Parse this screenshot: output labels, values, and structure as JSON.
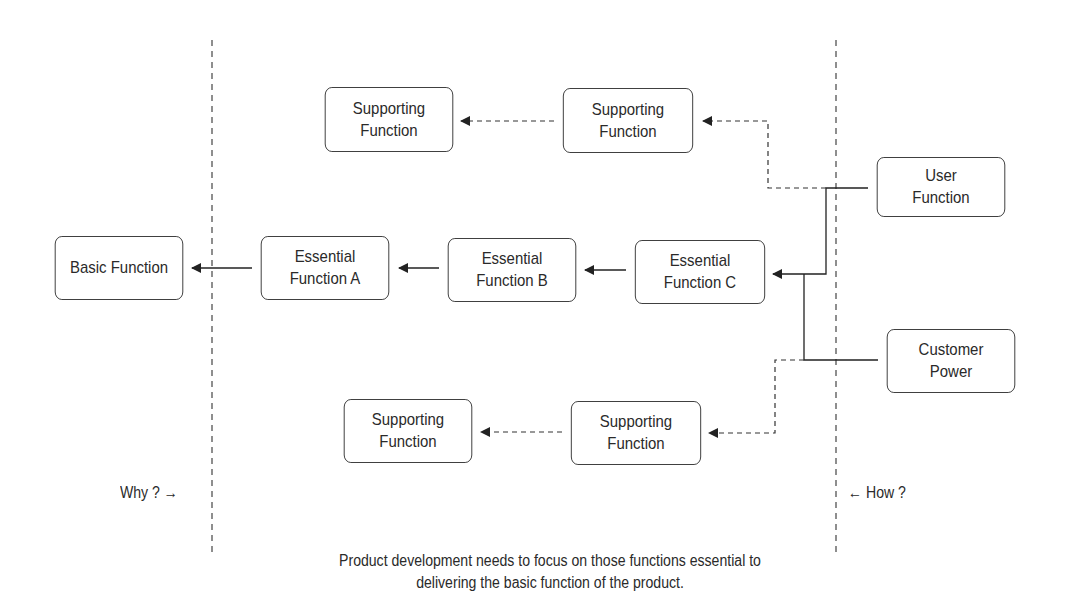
{
  "diagram": {
    "nodes": {
      "basic": {
        "line1": "Basic Function",
        "line2": ""
      },
      "ess_a": {
        "line1": "Essential",
        "line2": "Function A"
      },
      "ess_b": {
        "line1": "Essential",
        "line2": "Function B"
      },
      "ess_c": {
        "line1": "Essential",
        "line2": "Function C"
      },
      "sup_top_left": {
        "line1": "Supporting",
        "line2": "Function"
      },
      "sup_top_right": {
        "line1": "Supporting",
        "line2": "Function"
      },
      "sup_bot_left": {
        "line1": "Supporting",
        "line2": "Function"
      },
      "sup_bot_right": {
        "line1": "Supporting",
        "line2": "Function"
      },
      "user": {
        "line1": "User",
        "line2": "Function"
      },
      "customer": {
        "line1": "Customer",
        "line2": "Power"
      }
    },
    "labels": {
      "why": "Why ? →",
      "how": "← How ?"
    },
    "caption": {
      "line1": "Product development needs to focus on those functions essential to",
      "line2": "delivering the basic function of the product."
    }
  }
}
